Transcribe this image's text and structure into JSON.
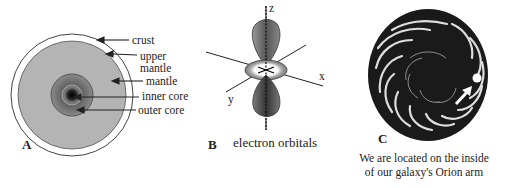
{
  "figure": {
    "panels": [
      {
        "letter": "A",
        "subject": "Earth interior",
        "labels": {
          "crust": "crust",
          "upper_mantle_line1": "upper",
          "upper_mantle_line2": "mantle",
          "mantle": "mantle",
          "inner_core": "inner core",
          "outer_core": "outer core"
        }
      },
      {
        "letter": "B",
        "caption": "electron orbitals",
        "axes": {
          "x": "x",
          "y": "y",
          "z": "z"
        }
      },
      {
        "letter": "C",
        "caption_line1": "We are located on the inside",
        "caption_line2": "of our galaxy's Orion arm"
      }
    ],
    "colors": {
      "mantle": "#b4b4b4",
      "outer_core": "#7a7a7a",
      "inner_core": "#0a0a0a",
      "orbital_lobe": "#6e6e6e",
      "galaxy": "#1a1a1a",
      "line": "#222222"
    }
  }
}
